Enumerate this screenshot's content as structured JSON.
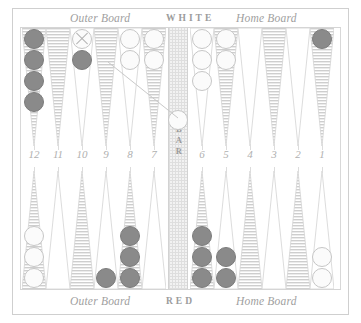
{
  "board": {
    "title": "Backgammon board diagram",
    "top_labels": {
      "outer": "Outer Board",
      "player": "WHITE",
      "home": "Home Board"
    },
    "bottom_labels": {
      "outer": "Outer Board",
      "player": "RED",
      "home": "Home Board"
    },
    "bar_label": "BAR",
    "colors": {
      "white_checker": "#fbfbfb",
      "white_checker_edge": "#c6c6c6",
      "red_checker": "#8a8a8a",
      "red_checker_edge": "#7c7c7c",
      "point_hatch": "#bdbdbd",
      "point_plain": "#ffffff",
      "frame": "#cfcfcf",
      "bar_fill": "#f2f2f2",
      "text": "#a0a0a0"
    },
    "point_numbers_top": [
      "12",
      "11",
      "10",
      "9",
      "8",
      "7"
    ],
    "point_numbers_bottom": [
      "6",
      "5",
      "4",
      "3",
      "2",
      "1"
    ],
    "points": [
      {
        "number": "12",
        "row": "top",
        "slot": 0,
        "style": "hatched",
        "checkers": 4,
        "color": "red",
        "marked": false
      },
      {
        "number": "11",
        "row": "top",
        "slot": 1,
        "style": "hatched",
        "checkers": 0,
        "color": "none",
        "marked": false
      },
      {
        "number": "10",
        "row": "top",
        "slot": 2,
        "style": "plain",
        "checkers": 2,
        "color": "mixed",
        "marked": true
      },
      {
        "number": "9",
        "row": "top",
        "slot": 3,
        "style": "hatched",
        "checkers": 0,
        "color": "none",
        "marked": false
      },
      {
        "number": "8",
        "row": "top",
        "slot": 4,
        "style": "plain",
        "checkers": 2,
        "color": "white",
        "marked": false
      },
      {
        "number": "7",
        "row": "top",
        "slot": 5,
        "style": "hatched",
        "checkers": 2,
        "color": "white",
        "marked": false
      },
      {
        "number": "6",
        "row": "top",
        "slot": 6,
        "style": "plain",
        "checkers": 3,
        "color": "white",
        "marked": false
      },
      {
        "number": "5",
        "row": "top",
        "slot": 7,
        "style": "hatched",
        "checkers": 2,
        "color": "white",
        "marked": false
      },
      {
        "number": "4",
        "row": "top",
        "slot": 8,
        "style": "plain",
        "checkers": 0,
        "color": "none",
        "marked": false
      },
      {
        "number": "3",
        "row": "top",
        "slot": 9,
        "style": "hatched",
        "checkers": 0,
        "color": "none",
        "marked": false
      },
      {
        "number": "2",
        "row": "top",
        "slot": 10,
        "style": "plain",
        "checkers": 0,
        "color": "none",
        "marked": false
      },
      {
        "number": "1",
        "row": "top",
        "slot": 11,
        "style": "hatched",
        "checkers": 1,
        "color": "red",
        "marked": false
      },
      {
        "number": "13",
        "row": "bottom",
        "slot": 0,
        "style": "hatched",
        "checkers": 3,
        "color": "white",
        "marked": false
      },
      {
        "number": "14",
        "row": "bottom",
        "slot": 1,
        "style": "plain",
        "checkers": 0,
        "color": "none",
        "marked": false
      },
      {
        "number": "15",
        "row": "bottom",
        "slot": 2,
        "style": "hatched",
        "checkers": 0,
        "color": "none",
        "marked": false
      },
      {
        "number": "16",
        "row": "bottom",
        "slot": 3,
        "style": "plain",
        "checkers": 1,
        "color": "red",
        "marked": false
      },
      {
        "number": "17",
        "row": "bottom",
        "slot": 4,
        "style": "hatched",
        "checkers": 3,
        "color": "red",
        "marked": false
      },
      {
        "number": "18",
        "row": "bottom",
        "slot": 5,
        "style": "plain",
        "checkers": 0,
        "color": "none",
        "marked": false
      },
      {
        "number": "19",
        "row": "bottom",
        "slot": 6,
        "style": "hatched",
        "checkers": 3,
        "color": "red",
        "marked": false
      },
      {
        "number": "20",
        "row": "bottom",
        "slot": 7,
        "style": "plain",
        "checkers": 2,
        "color": "red",
        "marked": false
      },
      {
        "number": "21",
        "row": "bottom",
        "slot": 8,
        "style": "hatched",
        "checkers": 0,
        "color": "none",
        "marked": false
      },
      {
        "number": "22",
        "row": "bottom",
        "slot": 9,
        "style": "plain",
        "checkers": 0,
        "color": "none",
        "marked": false
      },
      {
        "number": "23",
        "row": "bottom",
        "slot": 10,
        "style": "hatched",
        "checkers": 0,
        "color": "none",
        "marked": false
      },
      {
        "number": "24",
        "row": "bottom",
        "slot": 11,
        "style": "plain",
        "checkers": 2,
        "color": "white",
        "marked": false
      }
    ],
    "bar_checkers": [
      {
        "color": "white",
        "count": 1
      }
    ],
    "move_arrow": {
      "from_point": "10",
      "to": "bar",
      "description": "marked white checker moving to the bar"
    }
  }
}
